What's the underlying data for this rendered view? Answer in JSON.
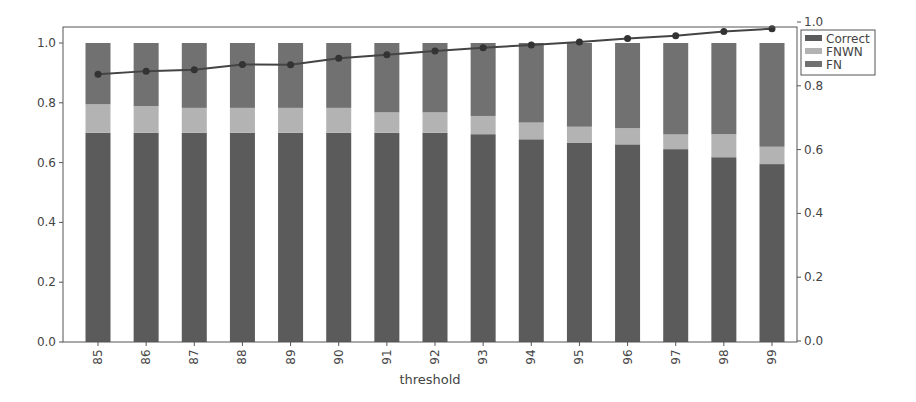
{
  "chart_data": {
    "type": "bar",
    "stacked": true,
    "title": "",
    "xlabel": "threshold",
    "ylabel": "",
    "ylabel_right": "",
    "categories": [
      "85",
      "86",
      "87",
      "88",
      "89",
      "90",
      "91",
      "92",
      "93",
      "94",
      "95",
      "96",
      "97",
      "98",
      "99"
    ],
    "series": [
      {
        "name": "Correct",
        "kind": "bar",
        "color": "#5b5b5b",
        "values": [
          0.7,
          0.7,
          0.7,
          0.7,
          0.7,
          0.7,
          0.7,
          0.7,
          0.695,
          0.678,
          0.667,
          0.661,
          0.645,
          0.618,
          0.595
        ]
      },
      {
        "name": "FNWN",
        "kind": "bar",
        "color": "#b3b3b3",
        "values": [
          0.095,
          0.089,
          0.083,
          0.083,
          0.083,
          0.083,
          0.068,
          0.068,
          0.061,
          0.056,
          0.053,
          0.054,
          0.049,
          0.077,
          0.058
        ]
      },
      {
        "name": "FN",
        "kind": "bar",
        "color": "#717171",
        "values": [
          0.205,
          0.211,
          0.217,
          0.217,
          0.217,
          0.217,
          0.232,
          0.232,
          0.244,
          0.266,
          0.28,
          0.285,
          0.306,
          0.305,
          0.347
        ]
      },
      {
        "name": "line",
        "kind": "line",
        "axis": "right",
        "color": "#444444",
        "marker": "circle",
        "values": [
          0.836,
          0.846,
          0.85,
          0.867,
          0.866,
          0.886,
          0.897,
          0.909,
          0.919,
          0.928,
          0.937,
          0.948,
          0.957,
          0.97,
          0.979
        ]
      }
    ],
    "ylim": [
      0,
      1.0
    ],
    "ylim_right": [
      0,
      1.0
    ],
    "yticks": [
      "0.0",
      "0.2",
      "0.4",
      "0.6",
      "0.8",
      "1.0"
    ],
    "yticks_right": [
      "0.0",
      "0.2",
      "0.4",
      "0.6",
      "0.8",
      "1.0"
    ],
    "grid": false,
    "legend": {
      "position": "upper right, outside plot",
      "entries": [
        "Correct",
        "FNWN",
        "FN"
      ]
    }
  }
}
